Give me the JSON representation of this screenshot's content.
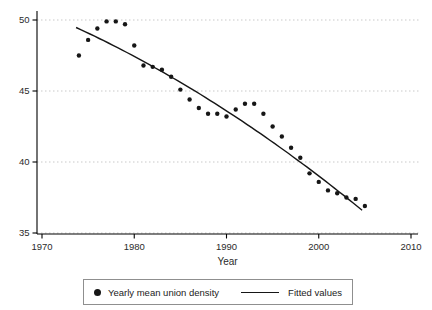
{
  "chart_data": {
    "type": "scatter",
    "title": "",
    "xlabel": "Year",
    "ylabel": "",
    "x_ticks": [
      1970,
      1980,
      1990,
      2000,
      2010
    ],
    "y_ticks": [
      35,
      40,
      45,
      50
    ],
    "xlim": [
      1969.5,
      2010.8
    ],
    "ylim": [
      34.9,
      50.7
    ],
    "grid": "horizontal-dotted",
    "legend_position": "bottom-center",
    "series": [
      {
        "name": "Yearly mean union density",
        "type": "scatter",
        "marker": "filled-circle",
        "color": "#161616",
        "x": [
          1974,
          1975,
          1976,
          1977,
          1978,
          1979,
          1980,
          1981,
          1982,
          1983,
          1984,
          1985,
          1986,
          1987,
          1988,
          1989,
          1990,
          1991,
          1992,
          1993,
          1994,
          1995,
          1996,
          1997,
          1998,
          1999,
          2000,
          2001,
          2002,
          2003,
          2004,
          2005
        ],
        "y": [
          47.5,
          48.6,
          49.4,
          49.9,
          49.9,
          49.7,
          48.2,
          46.8,
          46.7,
          46.5,
          46.0,
          45.1,
          44.4,
          43.8,
          43.4,
          43.4,
          43.2,
          43.7,
          44.1,
          44.1,
          43.4,
          42.5,
          41.8,
          41.0,
          40.3,
          39.2,
          38.6,
          38.0,
          37.8,
          37.5,
          37.4,
          36.9
        ]
      },
      {
        "name": "Fitted values",
        "type": "line",
        "color": "#161616",
        "fit": "quadratic",
        "coeffs_base_year": 1974,
        "coeffs": [
          49.38,
          -0.3013,
          -0.003745
        ],
        "domain": [
          1973.7,
          2004.7
        ]
      }
    ],
    "colors": {
      "axis": "#000000",
      "tick_label": "#2b2b2b",
      "gridline": "#c9c9c9",
      "background": "#ffffff"
    }
  },
  "legend": {
    "items": [
      {
        "label": "Yearly mean union density",
        "marker": "dot"
      },
      {
        "label": "Fitted values",
        "marker": "line"
      }
    ]
  }
}
